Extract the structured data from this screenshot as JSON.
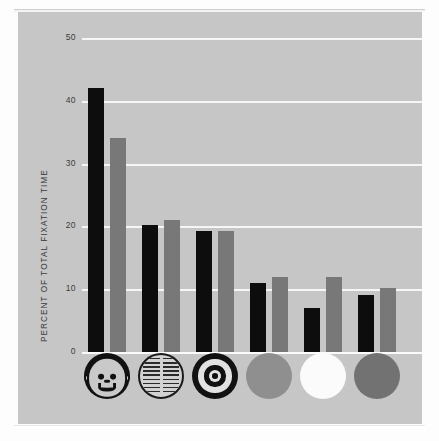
{
  "chart_data": {
    "type": "bar",
    "title": "",
    "subtitle": "",
    "xlabel": "",
    "ylabel": "PERCENT OF TOTAL FIXATION TIME",
    "ylim": [
      0,
      50
    ],
    "yticks": [
      0,
      10,
      20,
      30,
      40,
      50
    ],
    "ytick_labels": [
      "0",
      "10",
      "20",
      "30",
      "40",
      "50"
    ],
    "grid": "horizontal",
    "legend": "none",
    "categories": [
      "face",
      "newsprint",
      "bullseye",
      "red-disc",
      "white-disc",
      "yellow-disc"
    ],
    "category_labels": [
      "Face",
      "Newsprint",
      "Bull's-eye",
      "Red disc",
      "White disc",
      "Yellow disc"
    ],
    "series": [
      {
        "name": "Infants 2 to 3 months old",
        "color": "#0d0d0d",
        "values": [
          42.0,
          20.2,
          19.3,
          11.0,
          7.0,
          9.0
        ]
      },
      {
        "name": "Infants more than 3 months old",
        "color": "#787878",
        "values": [
          34.0,
          21.0,
          19.3,
          12.0,
          12.0,
          10.2
        ]
      }
    ]
  },
  "axis": {
    "ylabel_text": "PERCENT OF TOTAL FIXATION TIME",
    "tick_50": "50",
    "tick_40": "40",
    "tick_30": "30",
    "tick_20": "20",
    "tick_10": "10",
    "tick_0": "0"
  },
  "stimuli": [
    {
      "key": "face",
      "icon": "face-stimulus-icon",
      "label": "Face"
    },
    {
      "key": "newsprint",
      "icon": "newsprint-stimulus-icon",
      "label": "Newsprint"
    },
    {
      "key": "bullseye",
      "icon": "bullseye-stimulus-icon",
      "label": "Bull's-eye"
    },
    {
      "key": "red-disc",
      "icon": "red-disc-stimulus-icon",
      "label": "Red disc"
    },
    {
      "key": "white-disc",
      "icon": "white-disc-stimulus-icon",
      "label": "White disc"
    },
    {
      "key": "yellow-disc",
      "icon": "yellow-disc-stimulus-icon",
      "label": "Yellow disc"
    }
  ],
  "colors": {
    "panel_background": "#c6c6c6",
    "page_background": "#fdfdfd",
    "gridline": "#f6f6f6",
    "bar_dark": "#0d0d0d",
    "bar_light": "#787878",
    "text": "#3a3a3a",
    "disc_red": "#8f8f8f",
    "disc_white": "#fbfbfb",
    "disc_yellow": "#727272"
  }
}
